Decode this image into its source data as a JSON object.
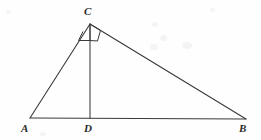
{
  "figure": {
    "kind": "geometry-diagram",
    "background_color": "#fefefe",
    "stroke_color": "#3a3a3a",
    "label_color": "#2b2b2b",
    "width": 261,
    "height": 140,
    "vertices": {
      "A": {
        "label": "A",
        "x": 30,
        "y": 118,
        "label_x": 21,
        "label_y": 123
      },
      "B": {
        "label": "B",
        "x": 246,
        "y": 119,
        "label_x": 239,
        "label_y": 123
      },
      "C": {
        "label": "C",
        "x": 90,
        "y": 24,
        "label_x": 84,
        "label_y": 6
      },
      "D": {
        "label": "D",
        "x": 90,
        "y": 118,
        "label_x": 84,
        "label_y": 123
      }
    },
    "segments": [
      {
        "name": "side-AC",
        "from": "A",
        "to": "C"
      },
      {
        "name": "side-CB",
        "from": "C",
        "to": "B"
      },
      {
        "name": "side-AB",
        "from": "A",
        "to": "B"
      },
      {
        "name": "altitude-CD",
        "from": "C",
        "to": "D"
      }
    ],
    "right_angle_marks": [
      {
        "name": "right-angle-at-C-left",
        "at": "C"
      },
      {
        "name": "right-angle-at-C-right",
        "at": "C"
      }
    ]
  }
}
